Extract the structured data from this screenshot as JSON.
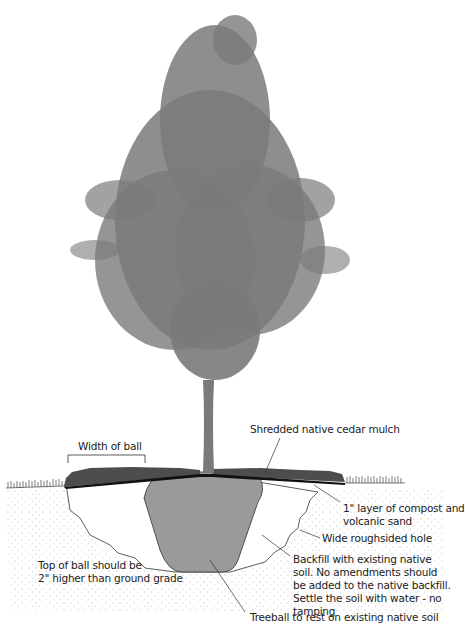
{
  "diagram": {
    "colors": {
      "tree": "#7a7a7a",
      "rootball": "#9a9a9a",
      "mulch": "#4a4a4a",
      "compost_layer": "#111111",
      "soil_dots": "#b5b5b5",
      "lines": "#333333",
      "background": "#ffffff"
    },
    "labels": {
      "width_of_ball": "Width of ball",
      "mulch": "Shredded native cedar mulch",
      "compost_line1": "1\" layer of compost and",
      "compost_line2": "volcanic sand",
      "hole": "Wide roughsided hole",
      "backfill": "Backfill with existing native soil. No amendments should be added to the native backfill. Settle the soil with water - no tamping",
      "top_of_ball_line1": "Top of ball should be",
      "top_of_ball_line2": "2\" higher than ground grade",
      "treeball": "Treeball to rest on existing native soil"
    }
  }
}
